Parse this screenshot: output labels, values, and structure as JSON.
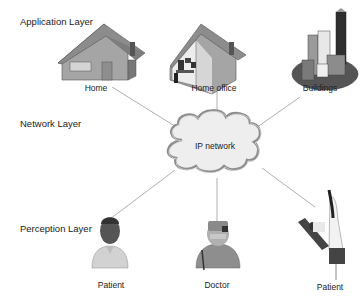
{
  "layers": {
    "application": "Application Layer",
    "network": "Network Layer",
    "perception": "Perception Layer"
  },
  "cloud": {
    "label": "IP network",
    "icon": "cloud-icon"
  },
  "application_nodes": [
    {
      "label": "Home",
      "icon": "house-icon"
    },
    {
      "label": "Home office",
      "icon": "home-office-icon"
    },
    {
      "label": "Buildings",
      "icon": "buildings-icon"
    }
  ],
  "perception_nodes": [
    {
      "label": "Patient",
      "icon": "patient-icon"
    },
    {
      "label": "Doctor",
      "icon": "doctor-icon"
    },
    {
      "label": "Patient",
      "icon": "nurse-patient-icon"
    }
  ],
  "colors": {
    "line": "#9a9a9a",
    "house_wall": "#a9a9a9",
    "house_roof": "#8a8a8a",
    "cloud_fill": "#eeeeee",
    "cloud_stroke": "#9a9a9a"
  }
}
